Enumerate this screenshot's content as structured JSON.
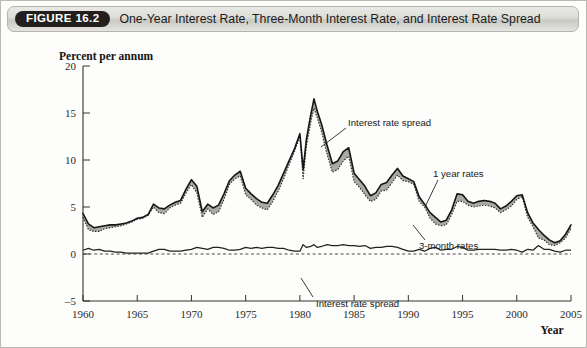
{
  "header": {
    "badge": "FIGURE 16.2",
    "title": "One-Year Interest Rate, Three-Month Interest Rate, and Interest Rate Spread"
  },
  "chart_data": {
    "type": "line",
    "title": "One-Year Interest Rate, Three-Month Interest Rate, and Interest Rate Spread",
    "xlabel": "Year",
    "ylabel": "Percent per annum",
    "xlim": [
      1960,
      2005
    ],
    "ylim": [
      -5,
      20
    ],
    "yticks": [
      -5,
      0,
      5,
      10,
      15,
      20
    ],
    "ytick_labels": [
      "–5",
      "0",
      "5",
      "10",
      "15",
      "20"
    ],
    "xticks": [
      1960,
      1965,
      1970,
      1975,
      1980,
      1985,
      1990,
      1995,
      2000,
      2005
    ],
    "xtick_labels": [
      "1960",
      "1965",
      "1970",
      "1975",
      "1980",
      "1985",
      "1990",
      "1995",
      "2000",
      "2005"
    ],
    "grid": false,
    "legend": "none",
    "zero_reference_line": {
      "value": 0,
      "style": "dashed"
    },
    "annotations": [
      {
        "text": "Interest rate spread",
        "target": "shaded-band-between-rates"
      },
      {
        "text": "1 year rates",
        "target": "one-year-rate-line"
      },
      {
        "text": "3-month rates",
        "target": "three-month-rate-line"
      },
      {
        "text": "Interest rate spread",
        "target": "spread-line-near-zero"
      }
    ],
    "x": [
      1960.0,
      1960.5,
      1961.0,
      1961.5,
      1962.0,
      1962.5,
      1963.0,
      1963.5,
      1964.0,
      1964.5,
      1965.0,
      1965.5,
      1966.0,
      1966.5,
      1967.0,
      1967.5,
      1968.0,
      1968.5,
      1969.0,
      1969.5,
      1970.0,
      1970.5,
      1971.0,
      1971.5,
      1972.0,
      1972.5,
      1973.0,
      1973.5,
      1974.0,
      1974.5,
      1975.0,
      1975.5,
      1976.0,
      1976.5,
      1977.0,
      1977.5,
      1978.0,
      1978.5,
      1979.0,
      1979.5,
      1980.0,
      1980.3,
      1980.6,
      1981.0,
      1981.3,
      1981.6,
      1982.0,
      1982.5,
      1983.0,
      1983.5,
      1984.0,
      1984.5,
      1985.0,
      1985.5,
      1986.0,
      1986.5,
      1987.0,
      1987.5,
      1988.0,
      1988.5,
      1989.0,
      1989.5,
      1990.0,
      1990.5,
      1991.0,
      1991.5,
      1992.0,
      1992.5,
      1993.0,
      1993.5,
      1994.0,
      1994.5,
      1995.0,
      1995.5,
      1996.0,
      1996.5,
      1997.0,
      1997.5,
      1998.0,
      1998.5,
      1999.0,
      1999.5,
      2000.0,
      2000.5,
      2001.0,
      2001.5,
      2002.0,
      2002.5,
      2003.0,
      2003.5,
      2004.0,
      2004.5,
      2005.0
    ],
    "series": [
      {
        "name": "1 year rates",
        "style": "solid",
        "values": [
          4.3,
          3.2,
          2.8,
          2.9,
          3.0,
          3.1,
          3.1,
          3.2,
          3.3,
          3.5,
          3.8,
          3.9,
          4.2,
          5.3,
          4.9,
          4.8,
          5.2,
          5.5,
          5.7,
          6.9,
          7.9,
          7.2,
          4.5,
          5.3,
          4.9,
          5.2,
          6.4,
          7.8,
          8.4,
          8.8,
          7.0,
          6.4,
          5.9,
          5.5,
          5.4,
          6.3,
          7.3,
          8.6,
          9.9,
          11.2,
          12.8,
          9.0,
          12.2,
          14.8,
          16.5,
          15.2,
          13.8,
          11.6,
          9.6,
          9.9,
          10.9,
          11.3,
          8.6,
          7.9,
          7.2,
          6.2,
          6.5,
          7.4,
          7.6,
          8.4,
          9.1,
          8.3,
          8.0,
          7.7,
          6.1,
          5.3,
          4.4,
          3.9,
          3.4,
          3.6,
          4.7,
          6.4,
          6.3,
          5.6,
          5.4,
          5.6,
          5.7,
          5.6,
          5.4,
          4.8,
          5.1,
          5.6,
          6.2,
          6.3,
          4.4,
          3.3,
          2.6,
          2.0,
          1.5,
          1.2,
          1.4,
          2.1,
          3.1
        ]
      },
      {
        "name": "3-month rates",
        "style": "dotted",
        "values": [
          3.9,
          2.6,
          2.4,
          2.4,
          2.7,
          2.8,
          2.9,
          3.0,
          3.2,
          3.4,
          3.7,
          3.8,
          4.1,
          5.0,
          4.4,
          4.3,
          4.9,
          5.2,
          5.4,
          6.5,
          7.4,
          6.5,
          3.9,
          4.8,
          4.2,
          4.5,
          5.8,
          7.4,
          8.0,
          8.3,
          6.3,
          5.8,
          5.2,
          4.9,
          4.7,
          5.6,
          6.7,
          8.0,
          9.5,
          10.9,
          12.5,
          8.0,
          11.5,
          14.0,
          15.5,
          14.5,
          13.0,
          10.6,
          8.7,
          9.0,
          9.9,
          10.4,
          7.7,
          7.1,
          6.3,
          5.6,
          5.8,
          6.7,
          6.8,
          7.6,
          8.4,
          7.8,
          7.7,
          7.4,
          5.6,
          5.0,
          3.8,
          3.2,
          3.0,
          3.1,
          4.2,
          5.6,
          5.6,
          5.2,
          5.0,
          5.1,
          5.2,
          5.1,
          4.9,
          4.4,
          4.7,
          5.1,
          5.8,
          6.1,
          3.9,
          2.9,
          1.7,
          1.5,
          1.0,
          0.9,
          1.2,
          1.7,
          2.7
        ]
      },
      {
        "name": "Interest rate spread",
        "style": "solid",
        "values": [
          0.4,
          0.6,
          0.4,
          0.5,
          0.3,
          0.3,
          0.2,
          0.2,
          0.1,
          0.1,
          0.1,
          0.1,
          0.1,
          0.3,
          0.5,
          0.5,
          0.3,
          0.3,
          0.3,
          0.4,
          0.5,
          0.7,
          0.6,
          0.5,
          0.7,
          0.7,
          0.6,
          0.4,
          0.4,
          0.5,
          0.7,
          0.6,
          0.7,
          0.6,
          0.7,
          0.7,
          0.6,
          0.6,
          0.4,
          0.3,
          0.3,
          1.0,
          0.7,
          0.8,
          1.0,
          0.7,
          0.8,
          1.0,
          0.9,
          0.9,
          1.0,
          0.9,
          0.9,
          0.8,
          0.9,
          0.6,
          0.7,
          0.7,
          0.8,
          0.8,
          0.7,
          0.5,
          0.3,
          0.3,
          0.5,
          0.3,
          0.6,
          0.7,
          0.4,
          0.5,
          0.5,
          0.8,
          0.7,
          0.4,
          0.4,
          0.5,
          0.5,
          0.5,
          0.5,
          0.4,
          0.4,
          0.5,
          0.4,
          0.2,
          0.5,
          0.4,
          0.9,
          0.5,
          0.5,
          0.3,
          0.2,
          0.4,
          0.4
        ]
      }
    ]
  }
}
